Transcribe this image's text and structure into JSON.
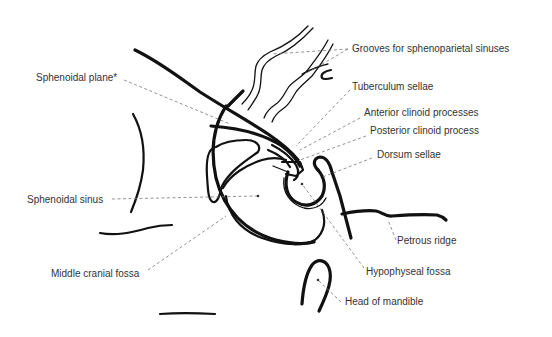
{
  "figure": {
    "type": "anatomical line drawing",
    "labels": [
      {
        "id": "grooves",
        "text": "Grooves for sphenoparietal sinuses"
      },
      {
        "id": "sphenoidal-plane",
        "text": "Sphenoidal plane*"
      },
      {
        "id": "tuberculum",
        "text": "Tuberculum sellae"
      },
      {
        "id": "anterior-clinoid",
        "text": "Anterior clinoid processes"
      },
      {
        "id": "posterior-clinoid",
        "text": "Posterior clinoid process"
      },
      {
        "id": "dorsum",
        "text": "Dorsum sellae"
      },
      {
        "id": "sphenoidal-sinus",
        "text": "Sphenoidal sinus"
      },
      {
        "id": "petrous",
        "text": "Petrous ridge"
      },
      {
        "id": "middle-fossa",
        "text": "Middle cranial fossa"
      },
      {
        "id": "hypophyseal",
        "text": "Hypophyseal fossa"
      },
      {
        "id": "mandible",
        "text": "Head of mandible"
      }
    ]
  }
}
